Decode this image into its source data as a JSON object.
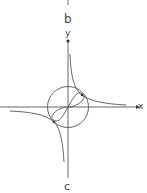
{
  "diagram": {
    "labels": {
      "top": "b",
      "y_axis": "y",
      "x_axis": "x",
      "bottom": "c"
    },
    "colors": {
      "stroke": "#555555",
      "text": "#444444",
      "background": "#ffffff"
    },
    "elements": [
      {
        "type": "axis",
        "name": "x-axis"
      },
      {
        "type": "axis",
        "name": "y-axis"
      },
      {
        "type": "circle",
        "center": [
          0,
          0
        ]
      },
      {
        "type": "lemniscate",
        "orientation": "45deg"
      },
      {
        "type": "hyperbola",
        "equation": "xy = k",
        "branches": [
          "quadrant I",
          "quadrant III"
        ]
      }
    ]
  }
}
